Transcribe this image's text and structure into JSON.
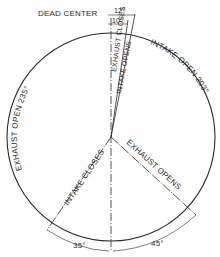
{
  "diagram": {
    "labels": {
      "dead_center": "DEAD CENTER",
      "angle_12": "12°",
      "angle_10": "10°",
      "exhaust_closes": "EXHAUST CLOSES",
      "intake_opens": "INTAKE OPENS",
      "intake_open_duration": "INTAKE OPEN 203°",
      "exhaust_open_duration": "EXHAUST OPEN 235°",
      "intake_closes": "INTAKE CLOSES",
      "exhaust_opens": "EXHAUST OPENS",
      "angle_35": "35°",
      "angle_45": "45°"
    },
    "events": [
      {
        "name": "Exhaust closes",
        "angle_after_tdc_deg": 10
      },
      {
        "name": "Intake opens",
        "angle_after_tdc_deg": 12
      },
      {
        "name": "Intake closes",
        "angle_after_bdc_deg": 35
      },
      {
        "name": "Exhaust opens",
        "angle_before_bdc_deg": 45
      }
    ],
    "durations": {
      "intake_open_deg": 203,
      "exhaust_open_deg": 235
    },
    "colors": {
      "ink": "#2a2a2a",
      "paper": "#ffffff"
    }
  }
}
